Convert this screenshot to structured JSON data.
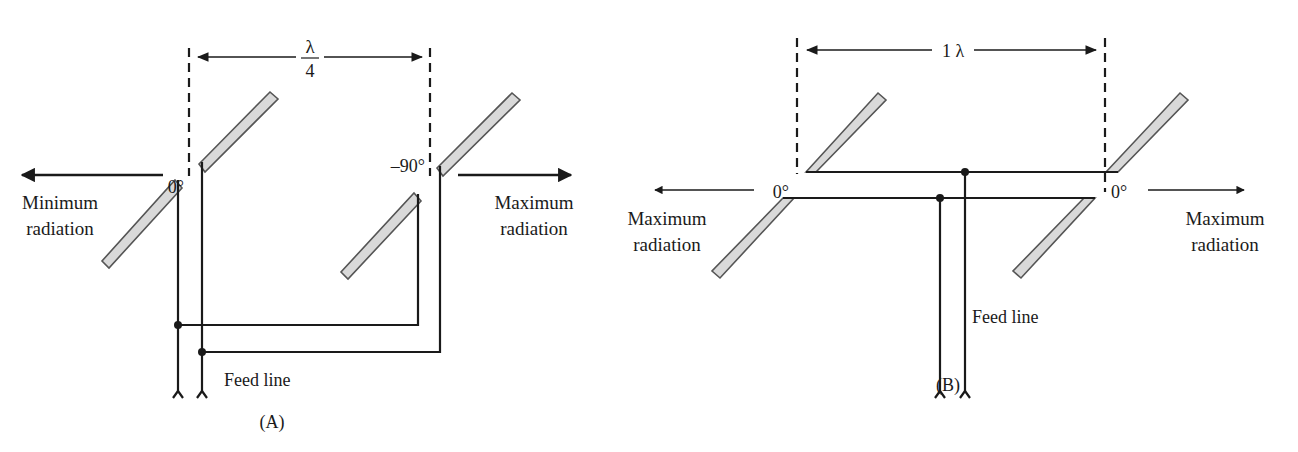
{
  "figure": {
    "panels": [
      {
        "id": "A",
        "caption": "(A)",
        "spacing_label_num": "λ",
        "spacing_label_den": "4",
        "spacing_description": "λ/4",
        "left_phase": "0°",
        "right_phase": "–90°",
        "left_radiation_line1": "Minimum",
        "left_radiation_line2": "radiation",
        "right_radiation_line1": "Maximum",
        "right_radiation_line2": "radiation",
        "feed_label": "Feed line"
      },
      {
        "id": "B",
        "caption": "(B)",
        "spacing_label": "1 λ",
        "left_phase": "0°",
        "right_phase": "0°",
        "left_radiation_line1": "Maximum",
        "left_radiation_line2": "radiation",
        "right_radiation_line1": "Maximum",
        "right_radiation_line2": "radiation",
        "feed_label": "Feed line"
      }
    ],
    "colors": {
      "line": "#1a1a1a",
      "element_fill": "#d9d9d9",
      "element_stroke": "#555555",
      "background": "#ffffff"
    }
  }
}
